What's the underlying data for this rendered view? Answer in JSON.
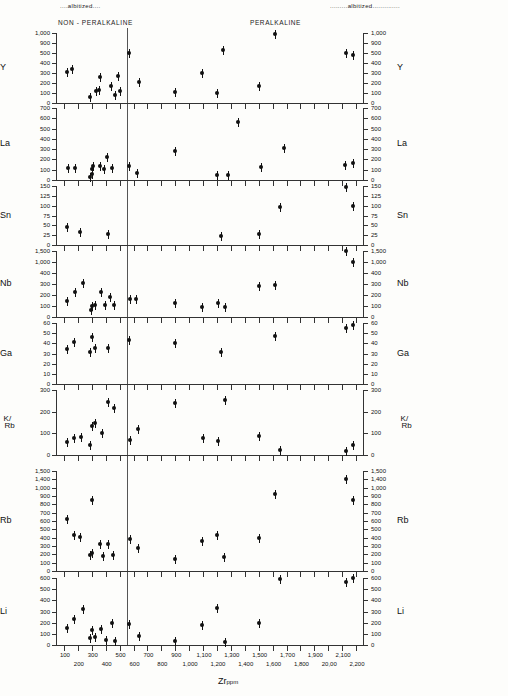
{
  "figure": {
    "header_left_alb": "....albitized....",
    "header_right_alb": ".........albitized..............",
    "group_left": "NON - PERALKALINE",
    "group_right": "PERALKALINE",
    "x_title": "Zr",
    "x_title_sub": "ppm",
    "divider_x_value": 550
  },
  "chart_data": {
    "type": "scatter",
    "xlabel": "Zr ppm",
    "xlim": [
      50,
      2250
    ],
    "grid": false,
    "legend": null,
    "annotations": [
      {
        "text": "NON - PERALKALINE",
        "x": 300
      },
      {
        "text": "PERALKALINE",
        "x": 1350
      },
      {
        "text": "....albitized....",
        "x": 280
      },
      {
        "text": ".........albitized..............",
        "x": 1850
      },
      {
        "text": "vertical divider",
        "x": 550
      }
    ],
    "x_ticks": [
      100,
      200,
      300,
      400,
      500,
      600,
      700,
      800,
      900,
      1000,
      1100,
      1200,
      1300,
      1400,
      1500,
      1600,
      1700,
      1800,
      1900,
      2000,
      2100,
      2200
    ],
    "x_tick_labels": [
      "100",
      "200",
      "300",
      "400",
      "500",
      "600",
      "700",
      "800",
      "900",
      "1,000",
      "1,100",
      "1,200",
      "1,300",
      "1,400",
      "1,500",
      "1,600",
      "1,700",
      "1,800",
      "1,900",
      "20,00",
      "2,100",
      "2,200"
    ],
    "panels": [
      {
        "name": "Y",
        "ylabel": "Y",
        "y_ticks": [
          0,
          100,
          200,
          300,
          400,
          500,
          900,
          1000
        ],
        "y_tick_labels": [
          "0",
          "100",
          "200",
          "300",
          "400",
          "500",
          "900",
          "1,000"
        ],
        "points": [
          {
            "x": 120,
            "y": 310
          },
          {
            "x": 160,
            "y": 340
          },
          {
            "x": 290,
            "y": 60
          },
          {
            "x": 330,
            "y": 120
          },
          {
            "x": 350,
            "y": 135
          },
          {
            "x": 360,
            "y": 265
          },
          {
            "x": 440,
            "y": 175
          },
          {
            "x": 470,
            "y": 85
          },
          {
            "x": 490,
            "y": 270
          },
          {
            "x": 505,
            "y": 120
          },
          {
            "x": 570,
            "y": 520
          },
          {
            "x": 640,
            "y": 215
          },
          {
            "x": 900,
            "y": 110
          },
          {
            "x": 1090,
            "y": 305
          },
          {
            "x": 1200,
            "y": 100
          },
          {
            "x": 1240,
            "y": 610
          },
          {
            "x": 1500,
            "y": 170
          },
          {
            "x": 1620,
            "y": 990
          },
          {
            "x": 2130,
            "y": 500
          },
          {
            "x": 2180,
            "y": 480
          }
        ]
      },
      {
        "name": "La",
        "ylabel": "La",
        "y_ticks": [
          0,
          100,
          200,
          300,
          400,
          500,
          600,
          700
        ],
        "y_tick_labels": [
          "0",
          "100",
          "200",
          "300",
          "400",
          "500",
          "600",
          "700"
        ],
        "points": [
          {
            "x": 130,
            "y": 120
          },
          {
            "x": 180,
            "y": 120
          },
          {
            "x": 290,
            "y": 30
          },
          {
            "x": 300,
            "y": 60
          },
          {
            "x": 305,
            "y": 110
          },
          {
            "x": 310,
            "y": 135
          },
          {
            "x": 360,
            "y": 135
          },
          {
            "x": 385,
            "y": 110
          },
          {
            "x": 410,
            "y": 225
          },
          {
            "x": 445,
            "y": 120
          },
          {
            "x": 570,
            "y": 135
          },
          {
            "x": 625,
            "y": 70
          },
          {
            "x": 900,
            "y": 285
          },
          {
            "x": 1200,
            "y": 45
          },
          {
            "x": 1280,
            "y": 50
          },
          {
            "x": 1350,
            "y": 565
          },
          {
            "x": 1520,
            "y": 125
          },
          {
            "x": 1680,
            "y": 315
          },
          {
            "x": 2120,
            "y": 145
          },
          {
            "x": 2180,
            "y": 170
          }
        ]
      },
      {
        "name": "Sn",
        "ylabel": "Sn",
        "y_ticks": [
          0,
          25,
          50,
          75,
          100,
          125,
          150
        ],
        "y_tick_labels": [
          "0",
          "25",
          "50",
          "75",
          "100",
          "125",
          "150"
        ],
        "points": [
          {
            "x": 120,
            "y": 47
          },
          {
            "x": 215,
            "y": 32
          },
          {
            "x": 420,
            "y": 29
          },
          {
            "x": 1230,
            "y": 23
          },
          {
            "x": 1500,
            "y": 29
          },
          {
            "x": 1650,
            "y": 97
          },
          {
            "x": 2130,
            "y": 147
          },
          {
            "x": 2175,
            "y": 100
          }
        ]
      },
      {
        "name": "Nb",
        "ylabel": "Nb",
        "y_ticks": [
          0,
          100,
          200,
          300,
          400,
          1000,
          1500
        ],
        "y_tick_labels": [
          "0",
          "100",
          "200",
          "300",
          "400",
          "1,000",
          "1,500"
        ],
        "points": [
          {
            "x": 120,
            "y": 150
          },
          {
            "x": 180,
            "y": 225
          },
          {
            "x": 240,
            "y": 305
          },
          {
            "x": 295,
            "y": 60
          },
          {
            "x": 300,
            "y": 100
          },
          {
            "x": 320,
            "y": 105
          },
          {
            "x": 365,
            "y": 230
          },
          {
            "x": 395,
            "y": 105
          },
          {
            "x": 430,
            "y": 180
          },
          {
            "x": 460,
            "y": 105
          },
          {
            "x": 575,
            "y": 165
          },
          {
            "x": 615,
            "y": 160
          },
          {
            "x": 900,
            "y": 125
          },
          {
            "x": 1090,
            "y": 90
          },
          {
            "x": 1210,
            "y": 130
          },
          {
            "x": 1260,
            "y": 90
          },
          {
            "x": 1500,
            "y": 285
          },
          {
            "x": 1620,
            "y": 290
          },
          {
            "x": 2130,
            "y": 1480
          },
          {
            "x": 2180,
            "y": 985
          }
        ]
      },
      {
        "name": "Ga",
        "ylabel": "Ga",
        "y_ticks": [
          0,
          10,
          20,
          30,
          40,
          50,
          60
        ],
        "y_tick_labels": [
          "0",
          "10",
          "20",
          "30",
          "40",
          "50",
          "60"
        ],
        "points": [
          {
            "x": 125,
            "y": 34
          },
          {
            "x": 175,
            "y": 41
          },
          {
            "x": 290,
            "y": 31
          },
          {
            "x": 305,
            "y": 46
          },
          {
            "x": 320,
            "y": 35
          },
          {
            "x": 420,
            "y": 35
          },
          {
            "x": 570,
            "y": 43
          },
          {
            "x": 900,
            "y": 40
          },
          {
            "x": 1230,
            "y": 31
          },
          {
            "x": 1620,
            "y": 47
          },
          {
            "x": 2125,
            "y": 55
          },
          {
            "x": 2175,
            "y": 58
          }
        ]
      },
      {
        "name": "K/Rb",
        "ylabel": "K/Rb",
        "y_ticks": [
          0,
          100,
          200,
          300
        ],
        "y_tick_labels": [
          "0",
          "100",
          "200",
          "300"
        ],
        "points": [
          {
            "x": 125,
            "y": 58
          },
          {
            "x": 175,
            "y": 80
          },
          {
            "x": 220,
            "y": 82
          },
          {
            "x": 290,
            "y": 47
          },
          {
            "x": 300,
            "y": 133
          },
          {
            "x": 320,
            "y": 148
          },
          {
            "x": 370,
            "y": 101
          },
          {
            "x": 420,
            "y": 246
          },
          {
            "x": 460,
            "y": 215
          },
          {
            "x": 575,
            "y": 68
          },
          {
            "x": 630,
            "y": 120
          },
          {
            "x": 900,
            "y": 240
          },
          {
            "x": 1100,
            "y": 80
          },
          {
            "x": 1210,
            "y": 65
          },
          {
            "x": 1260,
            "y": 253
          },
          {
            "x": 1500,
            "y": 88
          },
          {
            "x": 1650,
            "y": 22
          },
          {
            "x": 2130,
            "y": 20
          },
          {
            "x": 2180,
            "y": 44
          }
        ]
      },
      {
        "name": "Rb",
        "ylabel": "Rb",
        "y_ticks": [
          0,
          100,
          200,
          300,
          400,
          500,
          600,
          700,
          800,
          900,
          1000,
          1400,
          1500
        ],
        "y_tick_labels": [
          "0",
          "100",
          "200",
          "300",
          "400",
          "500",
          "600",
          "700",
          "800",
          "900",
          "1,000",
          "1,400",
          "1,500"
        ],
        "points": [
          {
            "x": 120,
            "y": 620
          },
          {
            "x": 175,
            "y": 430
          },
          {
            "x": 215,
            "y": 405
          },
          {
            "x": 285,
            "y": 195
          },
          {
            "x": 300,
            "y": 215
          },
          {
            "x": 305,
            "y": 855
          },
          {
            "x": 360,
            "y": 325
          },
          {
            "x": 380,
            "y": 175
          },
          {
            "x": 420,
            "y": 330
          },
          {
            "x": 450,
            "y": 190
          },
          {
            "x": 575,
            "y": 390
          },
          {
            "x": 630,
            "y": 280
          },
          {
            "x": 900,
            "y": 150
          },
          {
            "x": 1090,
            "y": 355
          },
          {
            "x": 1200,
            "y": 430
          },
          {
            "x": 1250,
            "y": 165
          },
          {
            "x": 1500,
            "y": 395
          },
          {
            "x": 1620,
            "y": 920
          },
          {
            "x": 2130,
            "y": 1395
          },
          {
            "x": 2180,
            "y": 850
          }
        ]
      },
      {
        "name": "Li",
        "ylabel": "Li",
        "y_ticks": [
          0,
          100,
          200,
          300,
          400,
          500,
          600
        ],
        "y_tick_labels": [
          "0",
          "100",
          "200",
          "300",
          "400",
          "500",
          "600"
        ],
        "points": [
          {
            "x": 120,
            "y": 155
          },
          {
            "x": 175,
            "y": 230
          },
          {
            "x": 240,
            "y": 325
          },
          {
            "x": 290,
            "y": 60
          },
          {
            "x": 305,
            "y": 135
          },
          {
            "x": 320,
            "y": 75
          },
          {
            "x": 365,
            "y": 140
          },
          {
            "x": 400,
            "y": 45
          },
          {
            "x": 445,
            "y": 195
          },
          {
            "x": 470,
            "y": 40
          },
          {
            "x": 570,
            "y": 185
          },
          {
            "x": 640,
            "y": 80
          },
          {
            "x": 900,
            "y": 35
          },
          {
            "x": 1090,
            "y": 180
          },
          {
            "x": 1200,
            "y": 335
          },
          {
            "x": 1260,
            "y": 30
          },
          {
            "x": 1500,
            "y": 195
          },
          {
            "x": 1650,
            "y": 590
          },
          {
            "x": 2130,
            "y": 560
          },
          {
            "x": 2180,
            "y": 600
          }
        ]
      }
    ]
  }
}
